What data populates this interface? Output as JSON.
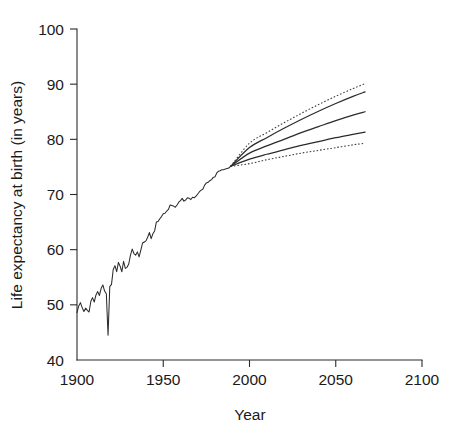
{
  "page": {
    "header_remnant": "                                                        "
  },
  "chart_data": {
    "type": "line",
    "title": "",
    "xlabel": "Year",
    "ylabel": "Life expectancy at birth (in years)",
    "xlim": [
      1900,
      2100
    ],
    "ylim": [
      40,
      100
    ],
    "xticks": [
      1900,
      1950,
      2000,
      2050,
      2100
    ],
    "yticks": [
      40,
      50,
      60,
      70,
      80,
      90,
      100
    ],
    "xtick_labels": [
      "1900",
      "1950",
      "2000",
      "2050",
      "2100"
    ],
    "ytick_labels": [
      "40",
      "50",
      "60",
      "70",
      "80",
      "90",
      "100"
    ],
    "grid": false,
    "legend": "none",
    "series": [
      {
        "name": "Historical life expectancy",
        "style": "solid",
        "x": [
          1900,
          1901,
          1902,
          1903,
          1904,
          1905,
          1906,
          1907,
          1908,
          1909,
          1910,
          1911,
          1912,
          1913,
          1914,
          1915,
          1916,
          1917,
          1918,
          1919,
          1920,
          1921,
          1922,
          1923,
          1924,
          1925,
          1926,
          1927,
          1928,
          1929,
          1930,
          1931,
          1932,
          1933,
          1934,
          1935,
          1936,
          1937,
          1938,
          1939,
          1940,
          1941,
          1942,
          1943,
          1944,
          1945,
          1946,
          1947,
          1948,
          1949,
          1950,
          1951,
          1952,
          1953,
          1954,
          1955,
          1956,
          1957,
          1958,
          1959,
          1960,
          1961,
          1962,
          1963,
          1964,
          1965,
          1966,
          1967,
          1968,
          1969,
          1970,
          1971,
          1972,
          1973,
          1974,
          1975,
          1976,
          1977,
          1978,
          1979,
          1980,
          1981,
          1982,
          1983,
          1984,
          1985,
          1986,
          1987,
          1988,
          1989
        ],
        "values": [
          48.6,
          49.8,
          50.4,
          49.5,
          48.8,
          49.4,
          49.0,
          48.7,
          50.6,
          51.3,
          50.5,
          51.8,
          52.4,
          51.7,
          53.0,
          53.6,
          52.5,
          52.0,
          44.5,
          53.3,
          53.7,
          56.4,
          57.1,
          56.0,
          57.7,
          57.0,
          56.0,
          57.9,
          56.6,
          56.8,
          57.4,
          59.0,
          60.1,
          59.3,
          59.0,
          59.6,
          58.7,
          59.9,
          61.2,
          61.4,
          61.6,
          62.3,
          63.1,
          62.0,
          62.9,
          63.4,
          65.0,
          65.1,
          65.6,
          66.0,
          66.5,
          66.6,
          67.0,
          67.3,
          68.1,
          68.0,
          67.9,
          67.7,
          68.1,
          68.6,
          68.9,
          69.3,
          68.8,
          69.0,
          69.4,
          69.3,
          69.1,
          69.5,
          69.4,
          69.7,
          70.1,
          70.5,
          70.8,
          71.0,
          71.7,
          72.1,
          72.2,
          72.5,
          72.7,
          73.1,
          73.2,
          73.9,
          74.2,
          74.3,
          74.5,
          74.5,
          74.6,
          74.7,
          74.8,
          75.1
        ]
      },
      {
        "name": "High projection",
        "style": "solid",
        "x": [
          1989,
          2000,
          2010,
          2020,
          2030,
          2040,
          2050,
          2060,
          2067
        ],
        "values": [
          75.1,
          78.5,
          80.3,
          82.0,
          83.6,
          85.1,
          86.5,
          87.8,
          88.6
        ]
      },
      {
        "name": "Middle projection",
        "style": "solid",
        "x": [
          1989,
          2000,
          2010,
          2020,
          2030,
          2040,
          2050,
          2060,
          2067
        ],
        "values": [
          75.1,
          77.5,
          78.8,
          80.0,
          81.2,
          82.3,
          83.4,
          84.4,
          85.0
        ]
      },
      {
        "name": "Low projection",
        "style": "solid",
        "x": [
          1989,
          2000,
          2010,
          2020,
          2030,
          2040,
          2050,
          2060,
          2067
        ],
        "values": [
          75.1,
          76.4,
          77.3,
          78.1,
          78.9,
          79.6,
          80.3,
          80.9,
          81.3
        ]
      },
      {
        "name": "Upper confidence bound",
        "style": "dotted",
        "x": [
          1989,
          2000,
          2010,
          2020,
          2030,
          2040,
          2050,
          2060,
          2067
        ],
        "values": [
          75.1,
          79.3,
          81.2,
          83.0,
          84.7,
          86.3,
          87.8,
          89.2,
          90.1
        ]
      },
      {
        "name": "Lower confidence bound",
        "style": "dotted",
        "x": [
          1989,
          2000,
          2010,
          2020,
          2030,
          2040,
          2050,
          2060,
          2067
        ],
        "values": [
          75.1,
          75.6,
          76.3,
          76.9,
          77.5,
          78.0,
          78.5,
          79.0,
          79.3
        ]
      }
    ],
    "annotations": [
      {
        "text": "Projections fan out from 1989",
        "x": 1989,
        "y": 75.1
      }
    ],
    "colors": {
      "axis": "#2b2b2b",
      "line": "#2b2b2b",
      "dotted": "#3a3a3a",
      "background": "#ffffff"
    }
  }
}
